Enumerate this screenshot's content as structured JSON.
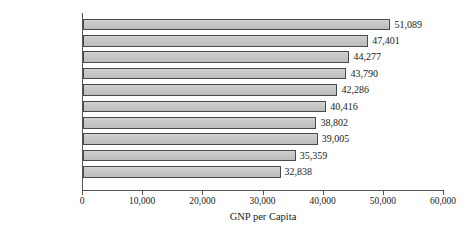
{
  "chart_data": {
    "type": "bar",
    "orientation": "horizontal",
    "title": "",
    "xlabel": "GNP per Capita",
    "ylabel": "",
    "xlim": [
      0,
      60000
    ],
    "xticks": [
      0,
      10000,
      20000,
      30000,
      40000,
      50000,
      60000
    ],
    "xtick_labels": [
      "0",
      "10,000",
      "20,000",
      "30,000",
      "40,000",
      "50,000",
      "60,000"
    ],
    "grid": false,
    "legend": false,
    "categories": [
      "Norway",
      "Singapore",
      "Luxembourg",
      "Denmark",
      "Switzerland",
      "Kuwait",
      "Japan",
      "United States",
      "Ireland",
      "Finland"
    ],
    "values": [
      51089,
      47401,
      44277,
      43790,
      42286,
      40416,
      38802,
      39005,
      35359,
      32838
    ],
    "value_labels": [
      "51,089",
      "47,401",
      "44,277",
      "43,790",
      "42,286",
      "40,416",
      "38,802",
      "39,005",
      "35,359",
      "32,838"
    ],
    "bar_fill_color": "#c6c6c6",
    "bar_border_color": "#4a4a4a",
    "axis_color": "#555555",
    "text_color": "#1a1a1a"
  }
}
